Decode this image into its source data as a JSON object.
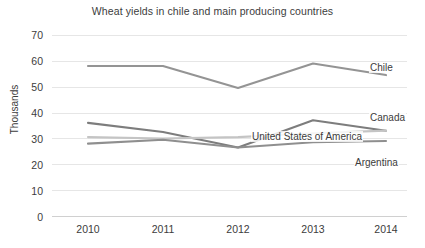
{
  "chart_data": {
    "type": "line",
    "title": "Wheat yields in chile and main producing countries",
    "xlabel": "",
    "ylabel": "Thousands",
    "categories": [
      "2010",
      "2011",
      "2012",
      "2013",
      "2014"
    ],
    "yticks": [
      "0",
      "10",
      "20",
      "30",
      "40",
      "50",
      "60",
      "70"
    ],
    "ylim": [
      0,
      70
    ],
    "grid": true,
    "legend_position": "right-inline-labels",
    "series": [
      {
        "name": "Chile",
        "color": "#949494",
        "values": [
          58,
          58,
          49.5,
          59,
          54.5
        ]
      },
      {
        "name": "Canada",
        "color": "#7d7d7d",
        "values": [
          36,
          32.5,
          26.5,
          37,
          33
        ]
      },
      {
        "name": "United States of America",
        "color": "#c4c4c4",
        "values": [
          30.5,
          30,
          30.5,
          32,
          33
        ]
      },
      {
        "name": "Argentina",
        "color": "#8f8f8f",
        "values": [
          28,
          29.5,
          26.5,
          28.5,
          29
        ]
      }
    ]
  },
  "labels": {
    "chile": "Chile",
    "canada": "Canada",
    "usa": "United States of America",
    "argentina": "Argentina"
  },
  "ytick_values": {
    "t0": "0",
    "t1": "10",
    "t2": "20",
    "t3": "30",
    "t4": "40",
    "t5": "50",
    "t6": "60",
    "t7": "70"
  },
  "xtick_values": {
    "x0": "2010",
    "x1": "2011",
    "x2": "2012",
    "x3": "2013",
    "x4": "2014"
  }
}
